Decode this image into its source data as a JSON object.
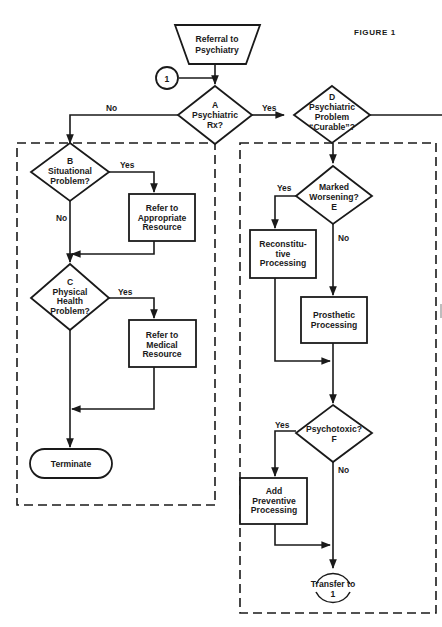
{
  "figure": {
    "label": "FIGURE 1"
  },
  "nodes": {
    "referral": {
      "lines": [
        "Referral to",
        "Psychiatry"
      ]
    },
    "connector_in": {
      "label": "1"
    },
    "A": {
      "lines": [
        "A",
        "Psychiatric",
        "Rx?"
      ]
    },
    "D": {
      "lines": [
        "D",
        "Psychiatric",
        "Problem",
        "“Curable”?"
      ]
    },
    "B": {
      "lines": [
        "B",
        "Situational",
        "Problem?"
      ]
    },
    "refer_appropriate": {
      "lines": [
        "Refer to",
        "Appropriate",
        "Resource"
      ]
    },
    "C": {
      "lines": [
        "C",
        "Physical",
        "Health",
        "Problem?"
      ]
    },
    "refer_medical": {
      "lines": [
        "Refer to",
        "Medical",
        "Resource"
      ]
    },
    "terminate": {
      "label": "Terminate"
    },
    "E": {
      "lines": [
        "Marked",
        "Worsening?",
        "E"
      ]
    },
    "reconstitutive": {
      "lines": [
        "Reconstitu-",
        "tive",
        "Processing"
      ]
    },
    "prosthetic": {
      "lines": [
        "Prosthetic",
        "Processing"
      ]
    },
    "F": {
      "lines": [
        "Psychotoxic?",
        "F"
      ]
    },
    "preventive": {
      "lines": [
        "Add",
        "Preventive",
        "Processing"
      ]
    },
    "transfer": {
      "lines": [
        "Transfer  to",
        "1"
      ]
    }
  },
  "edges": {
    "A_no": "No",
    "A_yes": "Yes",
    "B_yes": "Yes",
    "B_no": "No",
    "C_yes": "Yes",
    "E_yes": "Yes",
    "E_no": "No",
    "F_yes": "Yes",
    "F_no": "No"
  }
}
